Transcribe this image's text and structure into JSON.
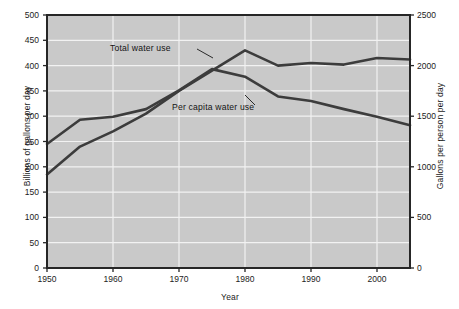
{
  "chart_data": {
    "type": "line",
    "title": "",
    "xlabel": "Year",
    "ylabel": "Billions of gallons per day",
    "ylabel_right": "Gallons per person per day",
    "xlim": [
      1950,
      2005
    ],
    "ylim": [
      0,
      500
    ],
    "ylim_right": [
      0,
      2500
    ],
    "grid": true,
    "legend_position": "inline-annotations",
    "xticks": [
      "1950",
      "1960",
      "1970",
      "1980",
      "1990",
      "2000"
    ],
    "xtick_values": [
      1950,
      1960,
      1970,
      1980,
      1990,
      2000
    ],
    "yticks_left": [
      "0",
      "50",
      "100",
      "150",
      "200",
      "250",
      "300",
      "350",
      "400",
      "450",
      "500"
    ],
    "ytick_values_left": [
      0,
      50,
      100,
      150,
      200,
      250,
      300,
      350,
      400,
      450,
      500
    ],
    "yticks_right": [
      "0",
      "500",
      "1000",
      "1500",
      "2000",
      "2500"
    ],
    "ytick_values_right": [
      0,
      500,
      1000,
      1500,
      2000,
      2500
    ],
    "x": [
      1950,
      1955,
      1960,
      1965,
      1970,
      1975,
      1980,
      1985,
      1990,
      1995,
      2000,
      2005
    ],
    "series": [
      {
        "name": "Total water use",
        "axis": "left",
        "units": "Billions of gallons per day",
        "color": "#3c3c3c",
        "values": [
          185,
          240,
          270,
          305,
          350,
          390,
          430,
          400,
          405,
          402,
          415,
          412
        ]
      },
      {
        "name": "Per capita water use",
        "axis": "right",
        "units": "Gallons per person per day",
        "color": "#3c3c3c",
        "values": [
          1225,
          1465,
          1495,
          1570,
          1755,
          1965,
          1890,
          1695,
          1650,
          1570,
          1495,
          1410
        ]
      }
    ],
    "annotations": [
      {
        "text": "Total water use",
        "x": 1962,
        "y": 432
      },
      {
        "text": "Per capita water use",
        "x": 1972,
        "y": 338
      }
    ],
    "colors": {
      "plot_background": "#c9c9c9",
      "gridline": "#f2f2f2",
      "frame": "#262626",
      "line": "#3c3c3c",
      "text": "#1c1c1c",
      "page_background": "#ffffff"
    }
  },
  "axes": {
    "left_title": "Billions of gallons per day",
    "right_title": "Gallons per person per day",
    "bottom_title": "Year"
  },
  "annotations": {
    "total": "Total water use",
    "per_capita": "Per capita water use"
  },
  "ticks": {
    "left": [
      "500",
      "450",
      "400",
      "350",
      "300",
      "250",
      "200",
      "150",
      "100",
      "50",
      "0"
    ],
    "right": [
      "2500",
      "2000",
      "1500",
      "1000",
      "500",
      "0"
    ],
    "bottom": [
      "1950",
      "1960",
      "1970",
      "1980",
      "1990",
      "2000"
    ]
  }
}
